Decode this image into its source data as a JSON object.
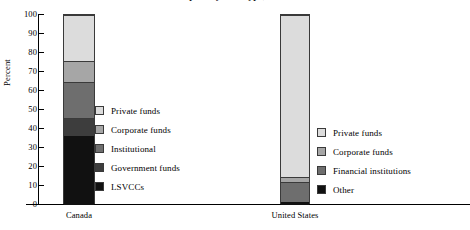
{
  "chart_data": {
    "type": "bar",
    "subtype": "stacked-100-percent",
    "title": "Venture capital by fund type, 2002",
    "xlabel": "",
    "ylabel": "Percent",
    "ylim": [
      0,
      100
    ],
    "yticks": [
      0,
      10,
      20,
      30,
      40,
      50,
      60,
      70,
      80,
      90,
      100
    ],
    "ytick_labels": [
      "0",
      "10",
      "20",
      "30",
      "40",
      "50",
      "60",
      "70",
      "80",
      "90",
      "100"
    ],
    "grid": false,
    "legend_position": "inside-right-of-each-bar",
    "categories": [
      "Canada",
      "United States"
    ],
    "groups": [
      {
        "category": "Canada",
        "segments": [
          {
            "name": "LSVCCs",
            "value": 36.5,
            "color": "#111111"
          },
          {
            "name": "Government funds",
            "value": 9.5,
            "color": "#3d3d3d"
          },
          {
            "name": "Institutional",
            "value": 18.5,
            "color": "#6e6e6e"
          },
          {
            "name": "Corporate funds",
            "value": 11.5,
            "color": "#a6a6a6"
          },
          {
            "name": "Private funds",
            "value": 24.0,
            "color": "#dcdcdc"
          }
        ],
        "cumulative_boundaries": [
          0,
          36.5,
          46.0,
          64.5,
          76.0,
          100.0
        ]
      },
      {
        "category": "United States",
        "segments": [
          {
            "name": "Other",
            "value": 1.5,
            "color": "#111111"
          },
          {
            "name": "Financial institutions",
            "value": 10.5,
            "color": "#6e6e6e"
          },
          {
            "name": "Corporate funds",
            "value": 2.5,
            "color": "#a6a6a6"
          },
          {
            "name": "Private funds",
            "value": 85.5,
            "color": "#dcdcdc"
          }
        ],
        "cumulative_boundaries": [
          0,
          1.5,
          12.0,
          14.5,
          100.0
        ]
      }
    ],
    "legends": [
      {
        "id": "canada",
        "entries": [
          {
            "label": "Private funds",
            "color": "#dcdcdc"
          },
          {
            "label": "Corporate funds",
            "color": "#a6a6a6"
          },
          {
            "label": "Institutional",
            "color": "#6e6e6e"
          },
          {
            "label": "Government funds",
            "color": "#3d3d3d"
          },
          {
            "label": "LSVCCs",
            "color": "#111111"
          }
        ]
      },
      {
        "id": "united_states",
        "entries": [
          {
            "label": "Private funds",
            "color": "#dcdcdc"
          },
          {
            "label": "Corporate funds",
            "color": "#a6a6a6"
          },
          {
            "label": "Financial institutions",
            "color": "#6e6e6e"
          },
          {
            "label": "Other",
            "color": "#111111"
          }
        ]
      }
    ]
  },
  "axis": {
    "y_label": "Percent"
  },
  "colors": {
    "axis": "#000000",
    "outline": "#3a3a3a",
    "background": "#ffffff"
  }
}
